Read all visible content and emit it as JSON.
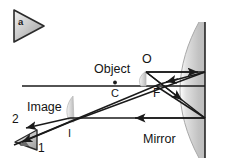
{
  "figure": {
    "panel_letter": "a",
    "width": 226,
    "height": 165,
    "background_color": "#ffffff",
    "line_color": "#1a1a1a",
    "mirror_fill_color": "#c9c9c9",
    "object_fill_color": "#d6d6d6"
  },
  "labels": {
    "object": "Object",
    "image": "Image",
    "mirror": "Mirror",
    "object_point": "O",
    "center_of_curvature": "C",
    "focal_point": "F",
    "image_point": "I",
    "ray_one": "1",
    "ray_two": "2"
  },
  "diagram_data": {
    "type": "ray-diagram",
    "description": "Concave mirror ray diagram: object beyond center of curvature forms a real, inverted image",
    "optical_axis": {
      "y": 86,
      "x_start": 22,
      "x_end": 205
    },
    "mirror": {
      "vertex_x": 205,
      "top_y": 22,
      "bottom_y": 158,
      "shape": "concave"
    },
    "points": [
      {
        "name": "O",
        "x": 146,
        "y": 72,
        "role": "object-top"
      },
      {
        "name": "C",
        "x": 115,
        "y": 86,
        "role": "center-of-curvature"
      },
      {
        "name": "F",
        "x": 156,
        "y": 86,
        "role": "focal-point"
      },
      {
        "name": "I",
        "x": 71,
        "y": 122,
        "role": "image-top"
      }
    ],
    "rays": [
      {
        "id": "1",
        "path": "O -> mirror (parallel to axis) -> reflects through F -> I"
      },
      {
        "id": "2",
        "path": "O -> mirror through F -> reflects parallel to axis -> I"
      }
    ]
  }
}
